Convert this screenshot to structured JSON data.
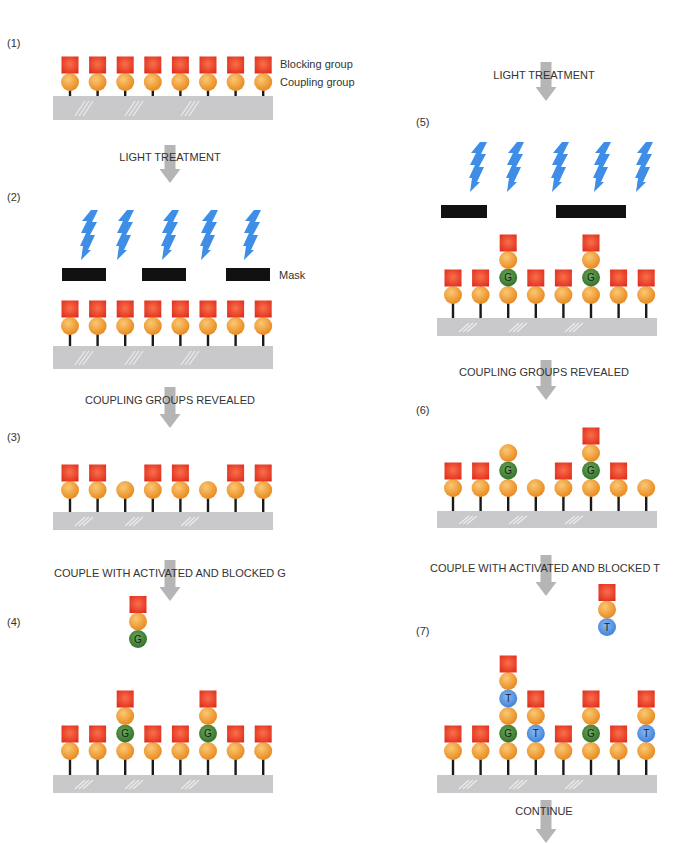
{
  "colors": {
    "blocking_group": "#ee3a1c",
    "coupling_group": "#f0a040",
    "nucleotide_G": "#3f8a35",
    "nucleotide_T": "#4a8fdc",
    "glass_chip": "#c9c9cb",
    "mask": "#111111",
    "light": "#3e8ee8",
    "arrow": "#b5b5b5"
  },
  "legend": {
    "blocking_group": "Blocking group",
    "coupling_group": "Coupling group",
    "mask": "Mask",
    "glass_chip": "Glass chip"
  },
  "steps": [
    {
      "id": "step-1",
      "label": "(1)"
    },
    {
      "id": "step-2",
      "label": "(2)"
    },
    {
      "id": "step-3",
      "label": "(3)"
    },
    {
      "id": "step-4",
      "label": "(4)"
    },
    {
      "id": "step-5",
      "label": "(5)"
    },
    {
      "id": "step-6",
      "label": "(6)"
    },
    {
      "id": "step-7",
      "label": "(7)"
    }
  ],
  "captions": {
    "light_treatment_1": "LIGHT TREATMENT",
    "revealed_1": "COUPLING GROUPS REVEALED",
    "couple_g": "COUPLE WITH ACTIVATED AND BLOCKED G",
    "light_treatment_2": "LIGHT TREATMENT",
    "revealed_2": "COUPLING GROUPS REVEALED",
    "couple_t": "COUPLE WITH ACTIVATED AND BLOCKED T",
    "continue": "CONTINUE"
  },
  "nucleotide_letters": {
    "G": "G",
    "T": "T"
  },
  "panels": {
    "step-1": {
      "stacks": [
        [
          "o",
          "B"
        ],
        [
          "o",
          "B"
        ],
        [
          "o",
          "B"
        ],
        [
          "o",
          "B"
        ],
        [
          "o",
          "B"
        ],
        [
          "o",
          "B"
        ],
        [
          "o",
          "B"
        ],
        [
          "o",
          "B"
        ]
      ]
    },
    "step-2": {
      "stacks": [
        [
          "o",
          "B"
        ],
        [
          "o",
          "B"
        ],
        [
          "o",
          "B"
        ],
        [
          "o",
          "B"
        ],
        [
          "o",
          "B"
        ],
        [
          "o",
          "B"
        ],
        [
          "o",
          "B"
        ],
        [
          "o",
          "B"
        ]
      ],
      "masks": 3,
      "light_bolts": 5
    },
    "step-3": {
      "stacks": [
        [
          "o",
          "B"
        ],
        [
          "o",
          "B"
        ],
        [
          "o"
        ],
        [
          "o",
          "B"
        ],
        [
          "o",
          "B"
        ],
        [
          "o"
        ],
        [
          "o",
          "B"
        ],
        [
          "o",
          "B"
        ]
      ]
    },
    "step-4": {
      "reagent": [
        "G",
        "o",
        "B"
      ],
      "stacks": [
        [
          "o",
          "B"
        ],
        [
          "o",
          "B"
        ],
        [
          "o",
          "G",
          "o",
          "B"
        ],
        [
          "o",
          "B"
        ],
        [
          "o",
          "B"
        ],
        [
          "o",
          "G",
          "o",
          "B"
        ],
        [
          "o",
          "B"
        ],
        [
          "o",
          "B"
        ]
      ]
    },
    "step-5": {
      "stacks": [
        [
          "o",
          "B"
        ],
        [
          "o",
          "B"
        ],
        [
          "o",
          "G",
          "o",
          "B"
        ],
        [
          "o",
          "B"
        ],
        [
          "o",
          "B"
        ],
        [
          "o",
          "G",
          "o",
          "B"
        ],
        [
          "o",
          "B"
        ],
        [
          "o",
          "B"
        ]
      ],
      "masks": 2,
      "light_bolts": 5
    },
    "step-6": {
      "stacks": [
        [
          "o",
          "B"
        ],
        [
          "o",
          "B"
        ],
        [
          "o",
          "G",
          "o"
        ],
        [
          "o"
        ],
        [
          "o",
          "B"
        ],
        [
          "o",
          "G",
          "o",
          "B"
        ],
        [
          "o",
          "B"
        ],
        [
          "o"
        ]
      ]
    },
    "step-7": {
      "reagent": [
        "T",
        "o",
        "B"
      ],
      "stacks": [
        [
          "o",
          "B"
        ],
        [
          "o",
          "B"
        ],
        [
          "o",
          "G",
          "o",
          "T",
          "o",
          "B"
        ],
        [
          "o",
          "T",
          "o",
          "B"
        ],
        [
          "o",
          "B"
        ],
        [
          "o",
          "G",
          "o",
          "B"
        ],
        [
          "o",
          "B"
        ],
        [
          "o",
          "T",
          "o",
          "B"
        ]
      ]
    }
  }
}
